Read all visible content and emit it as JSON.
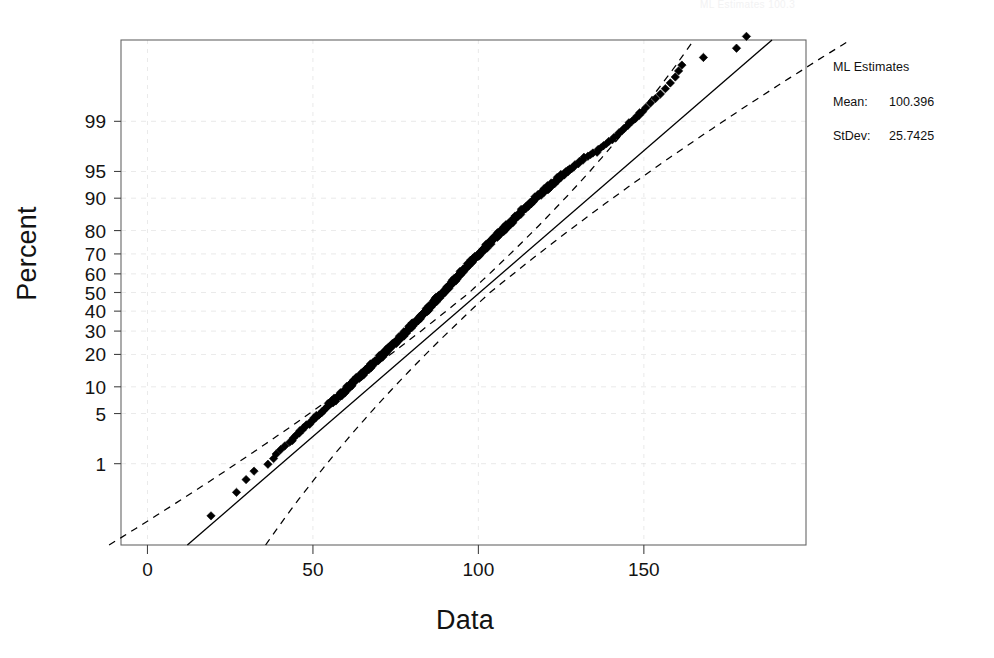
{
  "figure": {
    "width": 994,
    "height": 658,
    "background": "#ffffff",
    "ghost_header_text": "ML Estimates       100.3"
  },
  "legend": {
    "title": "ML Estimates",
    "rows": [
      {
        "key": "Mean:",
        "value": "100.396"
      },
      {
        "key": "StDev:",
        "value": "25.7425"
      }
    ]
  },
  "chart_data": {
    "type": "scatter",
    "title": "",
    "subtitle": "",
    "xlabel": "Data",
    "ylabel": "Percent",
    "grid": true,
    "legend_position": "right",
    "plot_box": {
      "left": 121,
      "top": 40,
      "right": 806,
      "bottom": 545
    },
    "xlim": [
      -8,
      199
    ],
    "xticks": [
      0,
      50,
      100,
      150
    ],
    "xtick_labels": [
      "0",
      "50",
      "100",
      "150"
    ],
    "yscale": "normal-probability",
    "yticks": [
      1,
      5,
      10,
      20,
      30,
      40,
      50,
      60,
      70,
      80,
      90,
      95,
      99
    ],
    "ytick_labels": [
      "1",
      "5",
      "10",
      "20",
      "30",
      "40",
      "50",
      "60",
      "70",
      "80",
      "90",
      "95",
      "99"
    ],
    "ylim_percent": [
      0.03,
      99.97
    ],
    "marker": "diamond",
    "marker_color": "#000000",
    "fit_line": {
      "label": "ML normal fit",
      "style": "solid",
      "color": "#000000",
      "mean": 100.396,
      "stdev": 25.7425
    },
    "confidence_bands": {
      "style": "dashed",
      "color": "#000000",
      "level_note": "approximate pointwise bands"
    },
    "n_points": 460,
    "points_note": "Normal probability plot of 460 observations; x from about 19 to 182, percent from about 0.1 to 99.9.",
    "points": [
      [
        19.2,
        0.12
      ],
      [
        26.9,
        0.33
      ],
      [
        29.8,
        0.55
      ],
      [
        32.2,
        0.76
      ],
      [
        36.4,
        0.98
      ],
      [
        38.1,
        1.2
      ],
      [
        38.9,
        1.41
      ],
      [
        40.2,
        1.63
      ],
      [
        41.5,
        1.85
      ],
      [
        43.0,
        2.1
      ],
      [
        44.1,
        2.4
      ],
      [
        45.2,
        2.7
      ],
      [
        46.0,
        3.0
      ],
      [
        47.1,
        3.3
      ],
      [
        48.0,
        3.6
      ],
      [
        49.2,
        3.9
      ],
      [
        50.1,
        4.2
      ],
      [
        51.0,
        4.5
      ],
      [
        51.8,
        4.8
      ],
      [
        52.6,
        5.1
      ],
      [
        53.4,
        5.5
      ],
      [
        54.1,
        5.9
      ],
      [
        54.9,
        6.3
      ],
      [
        55.6,
        6.7
      ],
      [
        56.3,
        7.1
      ],
      [
        57.0,
        7.5
      ],
      [
        57.7,
        7.9
      ],
      [
        58.4,
        8.3
      ],
      [
        59.0,
        8.7
      ],
      [
        59.7,
        9.1
      ],
      [
        60.3,
        9.6
      ],
      [
        61.0,
        10.1
      ],
      [
        61.6,
        10.6
      ],
      [
        62.2,
        11.1
      ],
      [
        62.8,
        11.6
      ],
      [
        63.4,
        12.1
      ],
      [
        64.0,
        12.6
      ],
      [
        64.6,
        13.1
      ],
      [
        65.2,
        13.6
      ],
      [
        65.8,
        14.2
      ],
      [
        66.4,
        14.8
      ],
      [
        67.0,
        15.4
      ],
      [
        67.5,
        16.0
      ],
      [
        68.1,
        16.6
      ],
      [
        68.7,
        17.2
      ],
      [
        69.2,
        17.8
      ],
      [
        69.8,
        18.4
      ],
      [
        70.3,
        19.0
      ],
      [
        70.9,
        19.7
      ],
      [
        71.4,
        20.4
      ],
      [
        72.0,
        21.1
      ],
      [
        72.5,
        21.8
      ],
      [
        73.0,
        22.5
      ],
      [
        73.6,
        23.2
      ],
      [
        74.1,
        23.9
      ],
      [
        74.6,
        24.6
      ],
      [
        75.1,
        25.3
      ],
      [
        75.7,
        26.0
      ],
      [
        76.2,
        26.8
      ],
      [
        76.7,
        27.6
      ],
      [
        77.2,
        28.4
      ],
      [
        77.7,
        29.2
      ],
      [
        78.2,
        30.0
      ],
      [
        78.7,
        30.8
      ],
      [
        79.2,
        31.6
      ],
      [
        79.7,
        32.4
      ],
      [
        80.2,
        33.2
      ],
      [
        80.7,
        34.0
      ],
      [
        81.2,
        34.9
      ],
      [
        81.7,
        35.8
      ],
      [
        82.2,
        36.7
      ],
      [
        82.7,
        37.6
      ],
      [
        83.2,
        38.5
      ],
      [
        83.7,
        39.4
      ],
      [
        84.2,
        40.3
      ],
      [
        84.7,
        41.2
      ],
      [
        85.2,
        42.1
      ],
      [
        85.7,
        43.0
      ],
      [
        86.2,
        44.0
      ],
      [
        86.7,
        45.0
      ],
      [
        87.2,
        46.0
      ],
      [
        87.7,
        47.0
      ],
      [
        88.2,
        48.0
      ],
      [
        88.8,
        49.0
      ],
      [
        89.3,
        50.0
      ],
      [
        89.8,
        51.0
      ],
      [
        90.3,
        52.0
      ],
      [
        90.8,
        53.0
      ],
      [
        91.3,
        54.0
      ],
      [
        91.9,
        55.0
      ],
      [
        92.4,
        56.0
      ],
      [
        92.9,
        57.0
      ],
      [
        93.4,
        58.0
      ],
      [
        94.0,
        59.0
      ],
      [
        94.5,
        60.0
      ],
      [
        95.0,
        61.0
      ],
      [
        95.6,
        62.0
      ],
      [
        96.1,
        63.0
      ],
      [
        96.7,
        64.0
      ],
      [
        97.2,
        65.0
      ],
      [
        97.8,
        66.0
      ],
      [
        98.4,
        67.0
      ],
      [
        98.9,
        68.0
      ],
      [
        99.5,
        69.0
      ],
      [
        100.1,
        70.0
      ],
      [
        100.7,
        70.9
      ],
      [
        101.3,
        71.8
      ],
      [
        101.9,
        72.7
      ],
      [
        102.5,
        73.6
      ],
      [
        103.1,
        74.5
      ],
      [
        103.8,
        75.4
      ],
      [
        104.4,
        76.3
      ],
      [
        105.0,
        77.2
      ],
      [
        105.7,
        78.1
      ],
      [
        106.4,
        79.0
      ],
      [
        107.0,
        79.8
      ],
      [
        107.7,
        80.6
      ],
      [
        108.4,
        81.4
      ],
      [
        109.1,
        82.2
      ],
      [
        109.8,
        83.0
      ],
      [
        110.6,
        83.8
      ],
      [
        111.3,
        84.6
      ],
      [
        112.1,
        85.4
      ],
      [
        112.8,
        86.2
      ],
      [
        113.6,
        87.0
      ],
      [
        114.4,
        87.7
      ],
      [
        115.3,
        88.4
      ],
      [
        116.1,
        89.1
      ],
      [
        117.0,
        89.8
      ],
      [
        117.9,
        90.4
      ],
      [
        118.8,
        91.0
      ],
      [
        119.8,
        91.6
      ],
      [
        120.8,
        92.2
      ],
      [
        121.8,
        92.8
      ],
      [
        122.9,
        93.3
      ],
      [
        124.0,
        93.8
      ],
      [
        125.1,
        94.3
      ],
      [
        126.3,
        94.8
      ],
      [
        127.5,
        95.2
      ],
      [
        128.8,
        95.6
      ],
      [
        130.2,
        96.0
      ],
      [
        131.6,
        96.4
      ],
      [
        133.1,
        96.8
      ],
      [
        134.6,
        97.1
      ],
      [
        136.2,
        97.4
      ],
      [
        137.8,
        97.7
      ],
      [
        139.4,
        98.0
      ],
      [
        141.0,
        98.25
      ],
      [
        142.5,
        98.5
      ],
      [
        143.9,
        98.7
      ],
      [
        145.2,
        98.85
      ],
      [
        146.4,
        99.0
      ],
      [
        147.5,
        99.1
      ],
      [
        148.6,
        99.2
      ],
      [
        149.6,
        99.3
      ],
      [
        150.6,
        99.4
      ],
      [
        152.0,
        99.5
      ],
      [
        153.5,
        99.58
      ],
      [
        155.0,
        99.65
      ],
      [
        156.5,
        99.72
      ],
      [
        158.0,
        99.78
      ],
      [
        159.5,
        99.83
      ],
      [
        160.5,
        99.87
      ],
      [
        161.5,
        99.9
      ],
      [
        168.0,
        99.93
      ],
      [
        178.0,
        99.955
      ],
      [
        181.0,
        99.975
      ]
    ]
  },
  "icons": {
    "marker_icon": "diamond-marker-icon"
  }
}
